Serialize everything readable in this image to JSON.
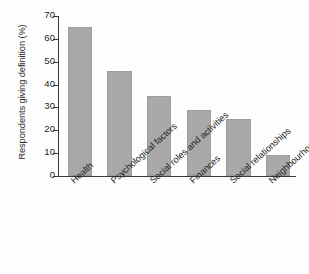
{
  "chart_data": {
    "type": "bar",
    "title": "",
    "xlabel": "",
    "ylabel": "Respondents giving definition (%)",
    "categories": [
      "Health",
      "Psychological factors",
      "Social roles and activities",
      "Finances",
      "Social relationships",
      "Neighbourhood"
    ],
    "values": [
      65,
      46,
      35,
      29,
      25,
      9
    ],
    "ylim": [
      0,
      70
    ],
    "yticks": [
      0,
      10,
      20,
      30,
      40,
      50,
      60,
      70
    ],
    "ytick_labels": [
      "0",
      "10",
      "20",
      "30",
      "40",
      "50",
      "60",
      "70"
    ],
    "grid": false,
    "legend": null,
    "bar_color": "#a9a9a9",
    "axis_color": "#3a3a3a",
    "background": "#fdfdfd"
  }
}
